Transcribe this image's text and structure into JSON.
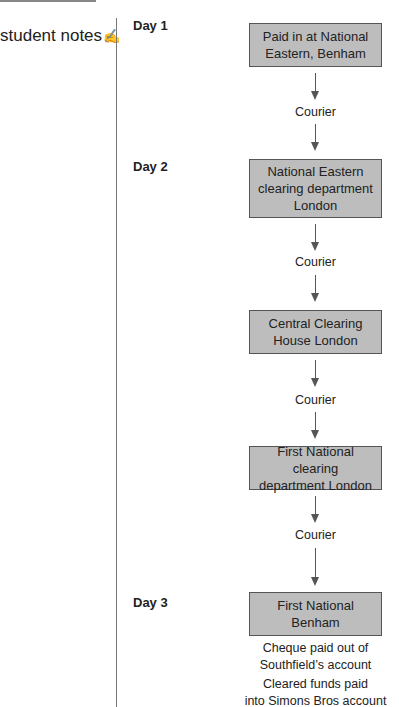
{
  "sidebar": {
    "title": "student notes",
    "icon": "pencil-notes-icon",
    "icon_glyph": "✍"
  },
  "diagram": {
    "days": [
      {
        "label": "Day 1"
      },
      {
        "label": "Day 2"
      },
      {
        "label": "Day 3"
      }
    ],
    "nodes": [
      {
        "id": "n1",
        "text": "Paid in at National Eastern, Benham",
        "lines": [
          "Paid in at National",
          "Eastern, Benham"
        ]
      },
      {
        "id": "n2",
        "text": "National Eastern clearing department London",
        "lines": [
          "National Eastern",
          "clearing department",
          "London"
        ]
      },
      {
        "id": "n3",
        "text": "Central Clearing House London",
        "lines": [
          "Central Clearing",
          "House London"
        ]
      },
      {
        "id": "n4",
        "text": "First National clearing department London",
        "lines": [
          "First National clearing",
          "department London"
        ]
      },
      {
        "id": "n5",
        "text": "First National Benham",
        "lines": [
          "First National",
          "Benham"
        ]
      }
    ],
    "edges": [
      {
        "from": "n1",
        "to": "n2",
        "label": "Courier"
      },
      {
        "from": "n2",
        "to": "n3",
        "label": "Courier"
      },
      {
        "from": "n3",
        "to": "n4",
        "label": "Courier"
      },
      {
        "from": "n4",
        "to": "n5",
        "label": "Courier"
      }
    ],
    "notes": [
      {
        "lines": [
          "Cheque paid out of",
          "Southfield’s account"
        ]
      },
      {
        "lines": [
          "Cleared funds paid",
          "into Simons Bros account"
        ]
      }
    ],
    "colors": {
      "box_fill": "#bdbdbd",
      "box_border": "#555555",
      "arrow": "#555555"
    }
  }
}
